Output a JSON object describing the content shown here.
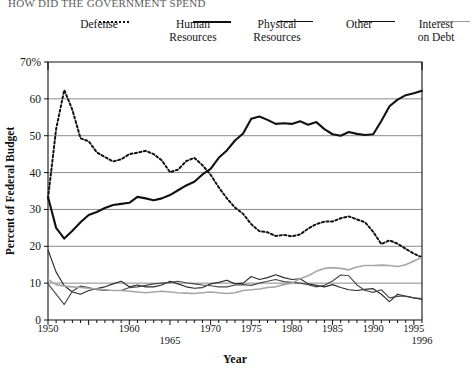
{
  "headline": {
    "text": "HOW DID THE GOVERNMENT SPEND"
  },
  "legend": {
    "position": "top",
    "items": [
      {
        "label_line1": "Defense",
        "label_line2": "",
        "style": "dotted",
        "color": "#111111",
        "name": "legend-defense"
      },
      {
        "label_line1": "Human",
        "label_line2": "Resources",
        "style": "solid-thick",
        "color": "#111111",
        "name": "legend-human-resources"
      },
      {
        "label_line1": "Physical",
        "label_line2": "Resources",
        "style": "solid-thin",
        "color": "#2b2b2b",
        "name": "legend-physical-resources"
      },
      {
        "label_line1": "Other",
        "label_line2": "",
        "style": "solid-thin",
        "color": "#4a4a4a",
        "name": "legend-other"
      },
      {
        "label_line1": "Interest",
        "label_line2": "on Debt",
        "style": "solid-gray",
        "color": "#a6a6a6",
        "name": "legend-interest-on-debt"
      }
    ]
  },
  "chart_data": {
    "type": "line",
    "title": "",
    "xlabel": "Year",
    "ylabel": "Percent of Federal Budget",
    "xlim": [
      1950,
      1996
    ],
    "ylim": [
      0,
      70
    ],
    "grid": true,
    "grid_axis": "y",
    "legend_position": "top",
    "ytick_labels": [
      "0",
      "10",
      "20",
      "30",
      "40",
      "50",
      "60",
      "70%"
    ],
    "ytick_values": [
      0,
      10,
      20,
      30,
      40,
      50,
      60,
      70
    ],
    "xtick_labels": [
      "1950",
      "1960",
      "1965",
      "1970",
      "1975",
      "1980",
      "1985",
      "1990",
      "1995",
      "1996"
    ],
    "xtick_values": [
      1950,
      1960,
      1965,
      1970,
      1975,
      1980,
      1985,
      1990,
      1995,
      1996
    ],
    "x": [
      1950,
      1951,
      1952,
      1953,
      1954,
      1955,
      1956,
      1957,
      1958,
      1959,
      1960,
      1961,
      1962,
      1963,
      1964,
      1965,
      1966,
      1967,
      1968,
      1969,
      1970,
      1971,
      1972,
      1973,
      1974,
      1975,
      1976,
      1977,
      1978,
      1979,
      1980,
      1981,
      1982,
      1983,
      1984,
      1985,
      1986,
      1987,
      1988,
      1989,
      1990,
      1991,
      1992,
      1993,
      1994,
      1995,
      1996
    ],
    "series": [
      {
        "name": "Defense",
        "style": "dotted",
        "color": "#111111",
        "values": [
          33.0,
          51.8,
          62.4,
          57.0,
          49.3,
          48.5,
          45.5,
          44.2,
          43.0,
          43.6,
          45.0,
          45.4,
          45.9,
          45.0,
          43.3,
          40.1,
          40.8,
          43.1,
          44.0,
          42.0,
          39.4,
          36.0,
          33.0,
          30.5,
          28.8,
          26.0,
          24.1,
          23.8,
          22.8,
          23.1,
          22.7,
          23.2,
          24.8,
          26.0,
          26.7,
          26.7,
          27.6,
          28.1,
          27.3,
          26.5,
          23.9,
          20.6,
          21.6,
          20.7,
          19.3,
          18.0,
          17.0
        ]
      },
      {
        "name": "Human Resources",
        "style": "solid-thick",
        "color": "#111111",
        "values": [
          33.4,
          25.0,
          22.1,
          24.2,
          26.5,
          28.5,
          29.3,
          30.4,
          31.2,
          31.5,
          31.8,
          33.4,
          33.0,
          32.5,
          33.0,
          33.9,
          35.2,
          36.5,
          37.5,
          39.5,
          41.0,
          44.0,
          46.0,
          48.7,
          50.6,
          54.6,
          55.2,
          54.3,
          53.2,
          53.4,
          53.2,
          53.9,
          53.0,
          53.7,
          51.8,
          50.4,
          50.0,
          51.0,
          50.5,
          50.2,
          50.4,
          54.0,
          58.0,
          59.8,
          61.0,
          61.5,
          62.2
        ]
      },
      {
        "name": "Physical Resources",
        "style": "solid-thin",
        "color": "#2b2b2b",
        "values": [
          19.0,
          13.0,
          9.3,
          7.6,
          7.0,
          8.0,
          8.5,
          9.0,
          9.8,
          10.5,
          9.0,
          9.5,
          9.0,
          9.0,
          9.5,
          10.5,
          9.8,
          9.0,
          8.6,
          8.8,
          9.8,
          10.2,
          10.8,
          9.8,
          10.0,
          11.8,
          11.0,
          11.5,
          12.3,
          11.5,
          11.0,
          11.2,
          9.8,
          9.4,
          9.0,
          9.6,
          8.8,
          8.2,
          8.0,
          8.3,
          8.5,
          7.0,
          5.0,
          7.0,
          6.4,
          6.0,
          5.6
        ]
      },
      {
        "name": "Other",
        "style": "solid-thin",
        "color": "#4a4a4a",
        "values": [
          9.8,
          7.0,
          4.2,
          7.8,
          9.2,
          8.8,
          8.2,
          8.0,
          8.0,
          8.0,
          8.8,
          9.0,
          9.4,
          9.8,
          10.0,
          10.2,
          10.5,
          10.1,
          9.8,
          9.5,
          9.3,
          9.0,
          9.0,
          9.5,
          9.6,
          9.4,
          10.0,
          10.5,
          11.0,
          10.4,
          10.2,
          10.0,
          9.6,
          9.0,
          9.4,
          10.6,
          12.2,
          12.0,
          9.5,
          8.0,
          7.5,
          8.2,
          6.0,
          6.4,
          6.5,
          6.0,
          5.8
        ]
      },
      {
        "name": "Interest on Debt",
        "style": "solid-gray",
        "color": "#a6a6a6",
        "values": [
          11.0,
          9.6,
          9.2,
          9.0,
          8.8,
          8.6,
          8.4,
          8.2,
          8.0,
          8.0,
          7.8,
          7.6,
          7.4,
          7.6,
          7.8,
          7.6,
          7.4,
          7.3,
          7.2,
          7.4,
          7.6,
          7.4,
          7.2,
          7.4,
          8.0,
          8.2,
          8.4,
          8.8,
          9.0,
          9.6,
          10.0,
          11.2,
          12.0,
          13.2,
          14.0,
          14.2,
          14.0,
          13.6,
          14.4,
          14.8,
          14.8,
          14.9,
          14.8,
          14.5,
          15.0,
          16.0,
          17.0
        ]
      }
    ]
  }
}
